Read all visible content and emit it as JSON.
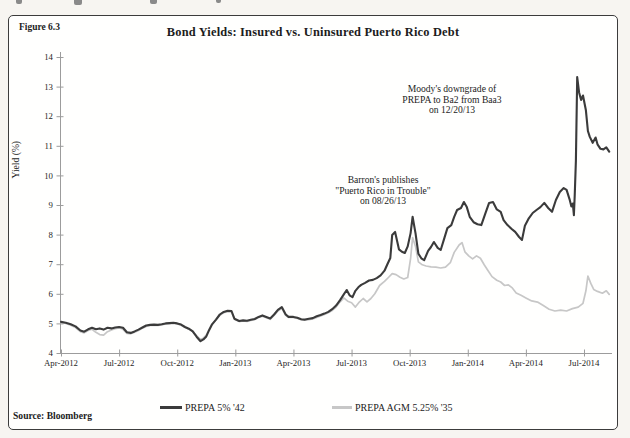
{
  "figure": {
    "label": "Figure 6.3",
    "source": "Source: Bloomberg"
  },
  "chart_data": {
    "type": "line",
    "title": "Bond Yields: Insured vs. Uninsured Puerto Rico Debt",
    "xlabel": "",
    "ylabel": "Yield (%)",
    "ylim": [
      4,
      14
    ],
    "grid": false,
    "legend_position": "bottom-center",
    "axis_color": "#9c9c9c",
    "text_color": "#1c1c1c",
    "y_ticks": [
      4,
      5,
      6,
      7,
      8,
      9,
      10,
      11,
      12,
      13,
      14
    ],
    "x_ticks": [
      {
        "month": 0,
        "label": "Apr-2012"
      },
      {
        "month": 3,
        "label": "Jul-2012"
      },
      {
        "month": 6,
        "label": "Oct-2012"
      },
      {
        "month": 9,
        "label": "Jan-2013"
      },
      {
        "month": 12,
        "label": "Apr-2013"
      },
      {
        "month": 15,
        "label": "Jul-2013"
      },
      {
        "month": 18,
        "label": "Oct-2013"
      },
      {
        "month": 21,
        "label": "Jan-2014"
      },
      {
        "month": 24,
        "label": "Apr-2014"
      },
      {
        "month": 27,
        "label": "Jul-2014"
      }
    ],
    "annotations": [
      {
        "lines": [
          "Moody's downgrade of",
          "PREPA  to Ba2 from Baa3",
          "on 12/20/13"
        ],
        "x": 452,
        "y": 84
      },
      {
        "lines": [
          "Barron's publishes",
          "\"Puerto Rico in Trouble\"",
          "on 08/26/13"
        ],
        "x": 383,
        "y": 175
      }
    ],
    "series": [
      {
        "name": "PREPA 5% '42",
        "color": "#3b3b3b",
        "stroke_width": 2.1,
        "points": [
          [
            0,
            5.05
          ],
          [
            0.25,
            5.02
          ],
          [
            0.5,
            4.97
          ],
          [
            0.75,
            4.9
          ],
          [
            1,
            4.76
          ],
          [
            1.2,
            4.72
          ],
          [
            1.4,
            4.8
          ],
          [
            1.6,
            4.85
          ],
          [
            1.8,
            4.8
          ],
          [
            2,
            4.83
          ],
          [
            2.2,
            4.79
          ],
          [
            2.4,
            4.85
          ],
          [
            2.6,
            4.83
          ],
          [
            2.8,
            4.86
          ],
          [
            3,
            4.88
          ],
          [
            3.2,
            4.85
          ],
          [
            3.4,
            4.7
          ],
          [
            3.6,
            4.68
          ],
          [
            3.8,
            4.73
          ],
          [
            4,
            4.79
          ],
          [
            4.2,
            4.86
          ],
          [
            4.4,
            4.93
          ],
          [
            4.6,
            4.95
          ],
          [
            4.8,
            4.96
          ],
          [
            5,
            4.95
          ],
          [
            5.2,
            4.97
          ],
          [
            5.4,
            5
          ],
          [
            5.6,
            5.01
          ],
          [
            5.8,
            5.02
          ],
          [
            6,
            5
          ],
          [
            6.2,
            4.96
          ],
          [
            6.4,
            4.88
          ],
          [
            6.6,
            4.82
          ],
          [
            6.8,
            4.73
          ],
          [
            7,
            4.55
          ],
          [
            7.2,
            4.4
          ],
          [
            7.35,
            4.46
          ],
          [
            7.5,
            4.56
          ],
          [
            7.65,
            4.78
          ],
          [
            7.8,
            4.97
          ],
          [
            8,
            5.13
          ],
          [
            8.2,
            5.3
          ],
          [
            8.4,
            5.39
          ],
          [
            8.6,
            5.43
          ],
          [
            8.8,
            5.42
          ],
          [
            8.95,
            5.16
          ],
          [
            9.2,
            5.08
          ],
          [
            9.4,
            5.1
          ],
          [
            9.6,
            5.09
          ],
          [
            9.8,
            5.12
          ],
          [
            10,
            5.15
          ],
          [
            10.2,
            5.22
          ],
          [
            10.4,
            5.27
          ],
          [
            10.6,
            5.22
          ],
          [
            10.8,
            5.17
          ],
          [
            11,
            5.3
          ],
          [
            11.2,
            5.46
          ],
          [
            11.4,
            5.55
          ],
          [
            11.6,
            5.3
          ],
          [
            11.75,
            5.22
          ],
          [
            12,
            5.22
          ],
          [
            12.2,
            5.19
          ],
          [
            12.4,
            5.14
          ],
          [
            12.6,
            5.13
          ],
          [
            12.8,
            5.16
          ],
          [
            13,
            5.18
          ],
          [
            13.2,
            5.24
          ],
          [
            13.4,
            5.28
          ],
          [
            13.6,
            5.33
          ],
          [
            13.8,
            5.39
          ],
          [
            14,
            5.48
          ],
          [
            14.2,
            5.6
          ],
          [
            14.4,
            5.78
          ],
          [
            14.6,
            5.98
          ],
          [
            14.75,
            6.13
          ],
          [
            14.9,
            5.95
          ],
          [
            15.05,
            5.89
          ],
          [
            15.2,
            6.1
          ],
          [
            15.35,
            6.22
          ],
          [
            15.5,
            6.3
          ],
          [
            15.7,
            6.37
          ],
          [
            15.9,
            6.45
          ],
          [
            16.1,
            6.47
          ],
          [
            16.3,
            6.53
          ],
          [
            16.5,
            6.62
          ],
          [
            16.7,
            6.78
          ],
          [
            16.85,
            7
          ],
          [
            17,
            7.21
          ],
          [
            17.1,
            7.99
          ],
          [
            17.25,
            8.09
          ],
          [
            17.45,
            7.5
          ],
          [
            17.6,
            7.42
          ],
          [
            17.75,
            7.38
          ],
          [
            17.9,
            7.6
          ],
          [
            18.05,
            8.05
          ],
          [
            18.15,
            8.6
          ],
          [
            18.3,
            8.05
          ],
          [
            18.45,
            7.35
          ],
          [
            18.6,
            7.2
          ],
          [
            18.75,
            7.14
          ],
          [
            18.95,
            7.45
          ],
          [
            19.1,
            7.58
          ],
          [
            19.25,
            7.75
          ],
          [
            19.45,
            7.55
          ],
          [
            19.6,
            7.48
          ],
          [
            19.8,
            7.9
          ],
          [
            19.95,
            8.22
          ],
          [
            20.15,
            8.32
          ],
          [
            20.3,
            8.6
          ],
          [
            20.45,
            8.83
          ],
          [
            20.65,
            8.9
          ],
          [
            20.8,
            9.1
          ],
          [
            20.95,
            8.93
          ],
          [
            21.1,
            8.6
          ],
          [
            21.3,
            8.42
          ],
          [
            21.5,
            8.35
          ],
          [
            21.7,
            8.32
          ],
          [
            21.9,
            8.7
          ],
          [
            22.1,
            9.07
          ],
          [
            22.3,
            9.1
          ],
          [
            22.5,
            8.85
          ],
          [
            22.7,
            8.77
          ],
          [
            22.85,
            8.49
          ],
          [
            23.05,
            8.32
          ],
          [
            23.25,
            8.2
          ],
          [
            23.45,
            8.09
          ],
          [
            23.65,
            7.92
          ],
          [
            23.8,
            7.82
          ],
          [
            23.95,
            8.3
          ],
          [
            24.15,
            8.55
          ],
          [
            24.35,
            8.73
          ],
          [
            24.55,
            8.83
          ],
          [
            24.75,
            8.93
          ],
          [
            24.95,
            9.07
          ],
          [
            25.15,
            8.9
          ],
          [
            25.35,
            8.77
          ],
          [
            25.55,
            9.17
          ],
          [
            25.75,
            9.44
          ],
          [
            25.95,
            9.57
          ],
          [
            26.1,
            9.51
          ],
          [
            26.25,
            9.2
          ],
          [
            26.35,
            8.95
          ],
          [
            26.42,
            9.05
          ],
          [
            26.48,
            8.66
          ],
          [
            26.52,
            9.3
          ],
          [
            26.58,
            10.5
          ],
          [
            26.65,
            13.32
          ],
          [
            26.75,
            12.8
          ],
          [
            26.85,
            12.55
          ],
          [
            26.95,
            12.7
          ],
          [
            27.1,
            12.2
          ],
          [
            27.2,
            11.5
          ],
          [
            27.3,
            11.3
          ],
          [
            27.45,
            11.1
          ],
          [
            27.6,
            11.28
          ],
          [
            27.7,
            11.05
          ],
          [
            27.85,
            10.9
          ],
          [
            28,
            10.88
          ],
          [
            28.15,
            10.95
          ],
          [
            28.3,
            10.8
          ]
        ]
      },
      {
        "name": "PREPA AGM 5.25% '35",
        "color": "#c7c7c7",
        "stroke_width": 1.7,
        "points": [
          [
            0,
            5.03
          ],
          [
            0.25,
            5
          ],
          [
            0.5,
            4.94
          ],
          [
            0.75,
            4.86
          ],
          [
            1,
            4.72
          ],
          [
            1.2,
            4.68
          ],
          [
            1.4,
            4.76
          ],
          [
            1.6,
            4.8
          ],
          [
            1.8,
            4.7
          ],
          [
            2,
            4.62
          ],
          [
            2.2,
            4.6
          ],
          [
            2.4,
            4.72
          ],
          [
            2.6,
            4.78
          ],
          [
            2.8,
            4.82
          ],
          [
            3,
            4.85
          ],
          [
            3.2,
            4.8
          ],
          [
            3.4,
            4.66
          ],
          [
            3.6,
            4.65
          ],
          [
            3.8,
            4.7
          ],
          [
            4,
            4.76
          ],
          [
            4.2,
            4.84
          ],
          [
            4.4,
            4.9
          ],
          [
            4.6,
            4.93
          ],
          [
            4.8,
            4.94
          ],
          [
            5,
            4.93
          ],
          [
            5.2,
            4.95
          ],
          [
            5.4,
            4.98
          ],
          [
            5.6,
            4.99
          ],
          [
            5.8,
            5
          ],
          [
            6,
            4.98
          ],
          [
            6.2,
            4.94
          ],
          [
            6.4,
            4.86
          ],
          [
            6.6,
            4.8
          ],
          [
            6.8,
            4.74
          ],
          [
            7,
            4.58
          ],
          [
            7.2,
            4.46
          ],
          [
            7.35,
            4.5
          ],
          [
            7.5,
            4.6
          ],
          [
            7.65,
            4.8
          ],
          [
            7.8,
            4.98
          ],
          [
            8,
            5.12
          ],
          [
            8.2,
            5.27
          ],
          [
            8.4,
            5.36
          ],
          [
            8.6,
            5.4
          ],
          [
            8.8,
            5.39
          ],
          [
            8.95,
            5.14
          ],
          [
            9.2,
            5.06
          ],
          [
            9.4,
            5.08
          ],
          [
            9.6,
            5.07
          ],
          [
            9.8,
            5.1
          ],
          [
            10,
            5.13
          ],
          [
            10.2,
            5.2
          ],
          [
            10.4,
            5.24
          ],
          [
            10.6,
            5.19
          ],
          [
            10.8,
            5.14
          ],
          [
            11,
            5.27
          ],
          [
            11.2,
            5.42
          ],
          [
            11.4,
            5.51
          ],
          [
            11.6,
            5.27
          ],
          [
            11.75,
            5.2
          ],
          [
            12,
            5.2
          ],
          [
            12.2,
            5.17
          ],
          [
            12.4,
            5.12
          ],
          [
            12.6,
            5.11
          ],
          [
            12.8,
            5.13
          ],
          [
            13,
            5.15
          ],
          [
            13.2,
            5.2
          ],
          [
            13.4,
            5.25
          ],
          [
            13.6,
            5.3
          ],
          [
            13.8,
            5.36
          ],
          [
            14,
            5.44
          ],
          [
            14.2,
            5.55
          ],
          [
            14.4,
            5.72
          ],
          [
            14.6,
            5.86
          ],
          [
            14.8,
            5.75
          ],
          [
            15,
            5.7
          ],
          [
            15.2,
            5.55
          ],
          [
            15.4,
            5.72
          ],
          [
            15.6,
            5.84
          ],
          [
            15.8,
            5.73
          ],
          [
            16,
            5.84
          ],
          [
            16.2,
            6
          ],
          [
            16.45,
            6.28
          ],
          [
            16.7,
            6.42
          ],
          [
            16.9,
            6.55
          ],
          [
            17.1,
            6.68
          ],
          [
            17.3,
            6.65
          ],
          [
            17.5,
            6.56
          ],
          [
            17.7,
            6.5
          ],
          [
            17.9,
            6.55
          ],
          [
            18.05,
            7.2
          ],
          [
            18.15,
            7.9
          ],
          [
            18.3,
            7.6
          ],
          [
            18.45,
            7.08
          ],
          [
            18.65,
            6.98
          ],
          [
            18.85,
            6.94
          ],
          [
            19.1,
            6.91
          ],
          [
            19.35,
            6.9
          ],
          [
            19.6,
            6.87
          ],
          [
            19.85,
            6.9
          ],
          [
            20.1,
            7.05
          ],
          [
            20.3,
            7.4
          ],
          [
            20.55,
            7.65
          ],
          [
            20.7,
            7.73
          ],
          [
            20.85,
            7.42
          ],
          [
            21.05,
            7.28
          ],
          [
            21.25,
            7.18
          ],
          [
            21.45,
            7.28
          ],
          [
            21.65,
            7.2
          ],
          [
            21.85,
            6.98
          ],
          [
            22.05,
            6.78
          ],
          [
            22.25,
            6.58
          ],
          [
            22.5,
            6.46
          ],
          [
            22.7,
            6.4
          ],
          [
            22.9,
            6.28
          ],
          [
            23.1,
            6.3
          ],
          [
            23.3,
            6.2
          ],
          [
            23.5,
            6.03
          ],
          [
            23.75,
            5.95
          ],
          [
            24,
            5.86
          ],
          [
            24.3,
            5.76
          ],
          [
            24.6,
            5.72
          ],
          [
            24.9,
            5.6
          ],
          [
            25.2,
            5.48
          ],
          [
            25.5,
            5.42
          ],
          [
            25.8,
            5.45
          ],
          [
            26.1,
            5.42
          ],
          [
            26.4,
            5.5
          ],
          [
            26.7,
            5.55
          ],
          [
            26.95,
            5.68
          ],
          [
            27.1,
            6.1
          ],
          [
            27.2,
            6.6
          ],
          [
            27.35,
            6.35
          ],
          [
            27.5,
            6.15
          ],
          [
            27.7,
            6.08
          ],
          [
            27.95,
            6.02
          ],
          [
            28.15,
            6.1
          ],
          [
            28.3,
            5.98
          ]
        ]
      }
    ]
  }
}
